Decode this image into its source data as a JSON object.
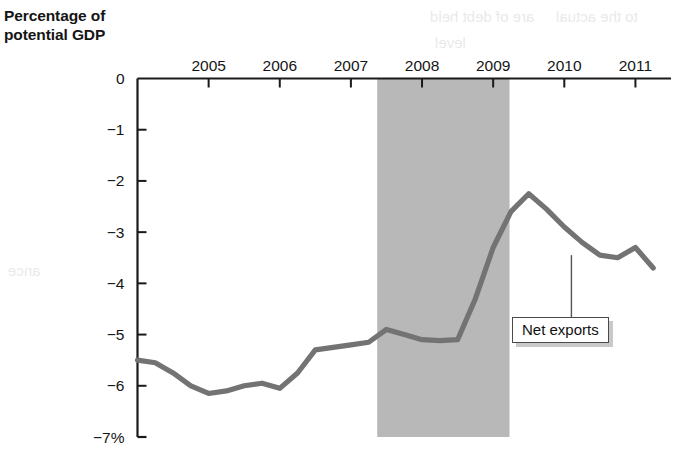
{
  "figure": {
    "axis_title_line1": "Percentage of",
    "axis_title_line2": "potential GDP",
    "callout_label": "Net exports",
    "ghost_text": [
      "are of debt held",
      "to the actual",
      "level",
      "ance"
    ]
  },
  "colors": {
    "line": "#737373",
    "recession_band": "#b8b8b8",
    "axis": "#1a1a1a",
    "text": "#151515",
    "callout_border": "#4a4a4a",
    "background": "#ffffff"
  },
  "chart_data": {
    "type": "line",
    "title": "Percentage of potential GDP",
    "xlabel": "",
    "ylabel": "Percentage of potential GDP",
    "xlim": [
      2004.0,
      2011.5
    ],
    "ylim": [
      -7,
      0
    ],
    "grid": false,
    "legend_position": "annotation",
    "xticks": [
      2005,
      2006,
      2007,
      2008,
      2009,
      2010,
      2011
    ],
    "xtick_labels": [
      "2005",
      "2006",
      "2007",
      "2008",
      "2009",
      "2010",
      "2011"
    ],
    "yticks": [
      0,
      -1,
      -2,
      -3,
      -4,
      -5,
      -6,
      -7
    ],
    "ytick_labels": [
      "0",
      "−1",
      "−2",
      "−3",
      "−4",
      "−5",
      "−6",
      "−7%"
    ],
    "annotations": [
      {
        "text": "Net exports",
        "points_to_x": 2010.1,
        "points_to_y": -3.45
      }
    ],
    "shaded_regions": [
      {
        "label": "recession",
        "x_start": 2007.37,
        "x_end": 2009.23,
        "color": "#b8b8b8"
      }
    ],
    "series": [
      {
        "name": "Net exports",
        "x": [
          2004.0,
          2004.25,
          2004.5,
          2004.75,
          2005.0,
          2005.25,
          2005.5,
          2005.75,
          2006.0,
          2006.25,
          2006.5,
          2006.75,
          2007.0,
          2007.25,
          2007.5,
          2007.75,
          2008.0,
          2008.25,
          2008.5,
          2008.75,
          2009.0,
          2009.25,
          2009.5,
          2009.75,
          2010.0,
          2010.25,
          2010.5,
          2010.75,
          2011.0,
          2011.25
        ],
        "values": [
          -5.5,
          -5.55,
          -5.75,
          -6.0,
          -6.15,
          -6.1,
          -6.0,
          -5.95,
          -6.05,
          -5.75,
          -5.3,
          -5.25,
          -5.2,
          -5.15,
          -4.9,
          -5.0,
          -5.1,
          -5.12,
          -5.1,
          -4.3,
          -3.3,
          -2.6,
          -2.25,
          -2.55,
          -2.9,
          -3.2,
          -3.45,
          -3.5,
          -3.3,
          -3.7
        ]
      }
    ]
  }
}
